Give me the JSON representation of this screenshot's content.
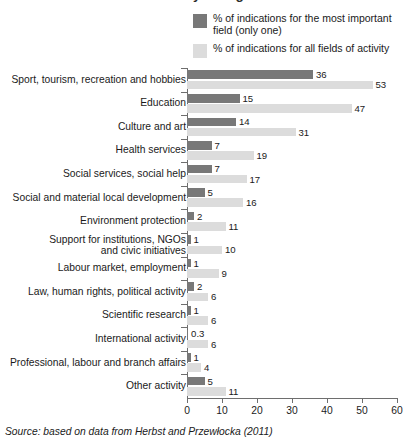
{
  "title_clipped": "Fields of activity of organisations",
  "legend": {
    "items": [
      {
        "label": "% of indications for the most\nimportant field (only one)",
        "color": "#787878",
        "name": "primary"
      },
      {
        "label": "% of indications for all fields of activity",
        "color": "#dcdcdc",
        "name": "secondary"
      }
    ]
  },
  "source": {
    "text": "Source: based on data from Herbst and Przewłocka (2011)"
  },
  "chart_data": {
    "type": "bar",
    "title": "Fields of activity of organisations",
    "orientation": "horizontal",
    "grouped": true,
    "xlabel": "",
    "ylabel": "",
    "xlim": [
      0,
      60
    ],
    "xticks": [
      0,
      10,
      20,
      30,
      40,
      50,
      60
    ],
    "grid": false,
    "legend_position": "top-right",
    "categories": [
      "Sport, tourism, recreation and hobbies",
      "Education",
      "Culture and art",
      "Health services",
      "Social services, social help",
      "Social and material local development",
      "Environment protection",
      "Support for institutions, NGOs\nand civic initiatives",
      "Labour market, employment",
      "Law, human rights, political activity",
      "Scientific research",
      "International activity",
      "Professional, labour and branch affairs",
      "Other activity"
    ],
    "series": [
      {
        "name": "% of indications for the most important field (only one)",
        "color": "#787878",
        "values": [
          36,
          15,
          14,
          7,
          7,
          5,
          2,
          1,
          1,
          2,
          1,
          0.3,
          1,
          5
        ],
        "labels": [
          "36",
          "15",
          "14",
          "7",
          "7",
          "5",
          "2",
          "1",
          "1",
          "2",
          "1",
          "0.3",
          "1",
          "5"
        ]
      },
      {
        "name": "% of indications for all fields of activity",
        "color": "#dcdcdc",
        "values": [
          53,
          47,
          31,
          19,
          17,
          16,
          11,
          10,
          9,
          6,
          6,
          6,
          4,
          11
        ],
        "labels": [
          "53",
          "47",
          "31",
          "19",
          "17",
          "16",
          "11",
          "10",
          "9",
          "6",
          "6",
          "6",
          "4",
          "11"
        ]
      }
    ]
  }
}
